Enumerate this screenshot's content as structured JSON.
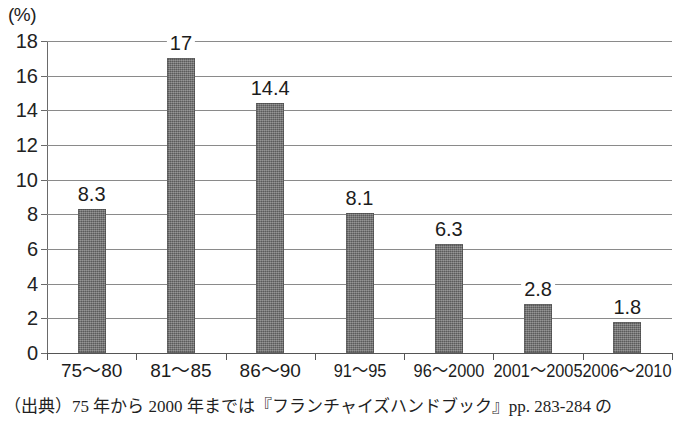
{
  "chart_data": {
    "type": "bar",
    "title": "",
    "subtitle": "",
    "xlabel": "",
    "ylabel": "",
    "unit_label": "(%)",
    "categories": [
      "75〜80",
      "81〜85",
      "86〜90",
      "91〜95",
      "96〜2000",
      "2001〜2005",
      "2006〜2010"
    ],
    "values": [
      8.3,
      17,
      14.4,
      8.1,
      6.3,
      2.8,
      1.8
    ],
    "value_labels": [
      "8.3",
      "17",
      "14.4",
      "8.1",
      "6.3",
      "2.8",
      "1.8"
    ],
    "ylim": [
      0,
      18
    ],
    "ytick_step": 2,
    "yticks": [
      18,
      16,
      14,
      12,
      10,
      8,
      6,
      4,
      2,
      0
    ],
    "ytick_labels": [
      "18",
      "16",
      "14",
      "12",
      "10",
      "8",
      "6",
      "4",
      "2",
      "0"
    ],
    "grid": true,
    "grid_axis": "y",
    "legend": false,
    "legend_position": "none",
    "bar_color": "#6f6f6f",
    "grid_color": "#8a8a8a",
    "axis_color": "#555555",
    "text_color": "#1c1c1c",
    "background_color": "#ffffff"
  },
  "caption": {
    "text": "（出典）75 年から 2000 年までは『フランチャイズハンドブック』pp. 283-284 の"
  }
}
